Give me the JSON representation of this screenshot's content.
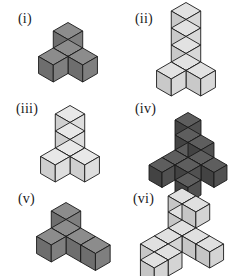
{
  "page": {
    "background_color": "#ffffff",
    "stroke_color": "#1a1a1a",
    "label_color": "#19191c"
  },
  "figures": [
    {
      "id": "fig-i",
      "label": "(i)",
      "label_x": 18,
      "label_y": 12,
      "origin_x": 68,
      "origin_y": 48,
      "cube_size": 17,
      "palette": {
        "top": "#8c8c8c",
        "left": "#6e6e6e",
        "right": "#7f7f7f"
      },
      "cube_count": 4,
      "shape_name": "tripod",
      "cubes": [
        [
          0,
          0,
          0
        ],
        [
          1,
          0,
          0
        ],
        [
          0,
          1,
          0
        ],
        [
          0,
          0,
          1
        ]
      ]
    },
    {
      "id": "fig-ii",
      "label": "(ii)",
      "label_x": 135,
      "label_y": 12,
      "origin_x": 186,
      "origin_y": 62,
      "cube_size": 17,
      "palette": {
        "top": "#e2e2e2",
        "left": "#c9c9c9",
        "right": "#d8d8d8"
      },
      "cube_count": 6,
      "shape_name": "tripod-with-two-stacked",
      "cubes": [
        [
          0,
          0,
          0
        ],
        [
          1,
          0,
          0
        ],
        [
          0,
          1,
          0
        ],
        [
          0,
          0,
          1
        ],
        [
          0,
          0,
          2
        ],
        [
          0,
          0,
          3
        ]
      ]
    },
    {
      "id": "fig-iii",
      "label": "(iii)",
      "label_x": 16,
      "label_y": 102,
      "origin_x": 70,
      "origin_y": 148,
      "cube_size": 17,
      "palette": {
        "top": "#e8e8e8",
        "left": "#cfcfcf",
        "right": "#dedede"
      },
      "cube_count": 5,
      "shape_name": "tripod-with-extended-vertical",
      "cubes": [
        [
          0,
          0,
          0
        ],
        [
          1,
          0,
          0
        ],
        [
          0,
          1,
          0
        ],
        [
          0,
          0,
          1
        ],
        [
          0,
          0,
          2
        ]
      ]
    },
    {
      "id": "fig-iv",
      "label": "(iv)",
      "label_x": 135,
      "label_y": 102,
      "origin_x": 188,
      "origin_y": 150,
      "cube_size": 15,
      "palette": {
        "top": "#5e5e5e",
        "left": "#434343",
        "right": "#515151"
      },
      "cube_count": 11,
      "shape_name": "extended-tripod-dark",
      "cubes": [
        [
          0,
          0,
          0
        ],
        [
          1,
          0,
          0
        ],
        [
          2,
          0,
          0
        ],
        [
          0,
          1,
          0
        ],
        [
          0,
          2,
          0
        ],
        [
          1,
          1,
          0
        ],
        [
          0,
          0,
          1
        ],
        [
          0,
          0,
          2
        ],
        [
          0,
          0,
          -1
        ],
        [
          0,
          0,
          -2
        ],
        [
          1,
          0,
          1
        ]
      ]
    },
    {
      "id": "fig-v",
      "label": "(v)",
      "label_x": 18,
      "label_y": 192,
      "origin_x": 66,
      "origin_y": 228,
      "cube_size": 17,
      "palette": {
        "top": "#8c8c8c",
        "left": "#6e6e6e",
        "right": "#7f7f7f"
      },
      "cube_count": 5,
      "shape_name": "tripod-with-extended-right-arm",
      "cubes": [
        [
          0,
          0,
          0
        ],
        [
          1,
          0,
          0
        ],
        [
          2,
          0,
          0
        ],
        [
          0,
          1,
          0
        ],
        [
          0,
          0,
          1
        ]
      ]
    },
    {
      "id": "fig-vi",
      "label": "(vi)",
      "label_x": 133,
      "label_y": 192,
      "origin_x": 182,
      "origin_y": 228,
      "cube_size": 16,
      "palette": {
        "top": "#e0e0e0",
        "left": "#c6c6c6",
        "right": "#d4d4d4"
      },
      "cube_count": 10,
      "shape_name": "extended-tripod-light",
      "cubes": [
        [
          0,
          0,
          0
        ],
        [
          1,
          0,
          0
        ],
        [
          2,
          0,
          0
        ],
        [
          0,
          1,
          0
        ],
        [
          0,
          2,
          0
        ],
        [
          0,
          0,
          1
        ],
        [
          0,
          0,
          2
        ],
        [
          1,
          0,
          2
        ],
        [
          0,
          1,
          -1
        ],
        [
          0,
          2,
          -1
        ]
      ]
    }
  ]
}
